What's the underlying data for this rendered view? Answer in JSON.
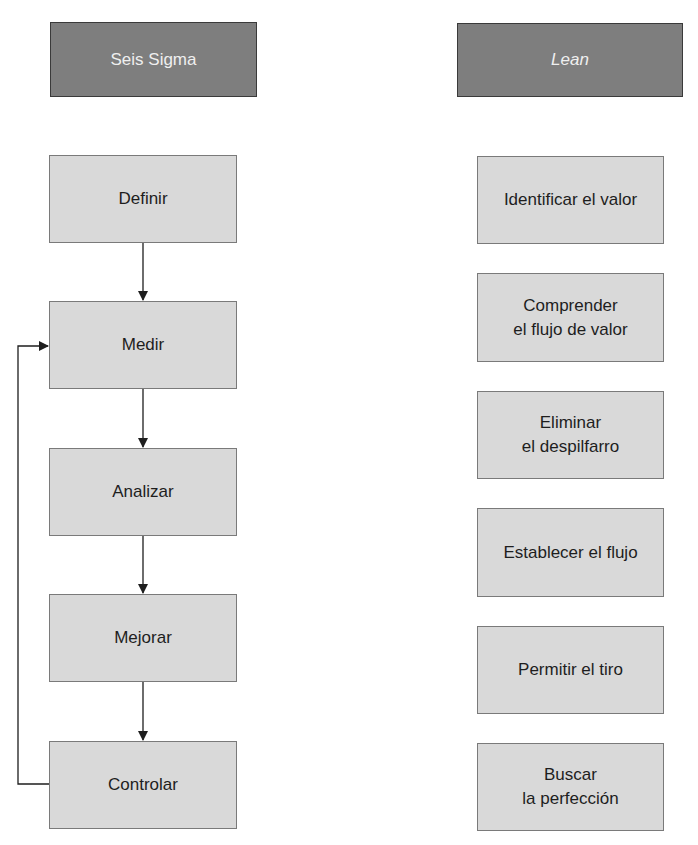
{
  "left_column": {
    "header": "Seis Sigma",
    "steps": [
      "Definir",
      "Medir",
      "Analizar",
      "Mejorar",
      "Controlar"
    ],
    "feedback_loop": {
      "from": "Controlar",
      "to": "Medir"
    }
  },
  "right_column": {
    "header": "Lean",
    "steps": [
      {
        "line1": "Identificar el valor",
        "line2": ""
      },
      {
        "line1": "Comprender",
        "line2": "el flujo de valor"
      },
      {
        "line1": "Eliminar",
        "line2": "el despilfarro"
      },
      {
        "line1": "Establecer el flujo",
        "line2": ""
      },
      {
        "line1": "Permitir el tiro",
        "line2": ""
      },
      {
        "line1": "Buscar",
        "line2": "la perfección"
      }
    ]
  },
  "colors": {
    "header_fill": "#7e7e7e",
    "step_fill": "#d9d9d9",
    "line": "#1e1e1e"
  }
}
